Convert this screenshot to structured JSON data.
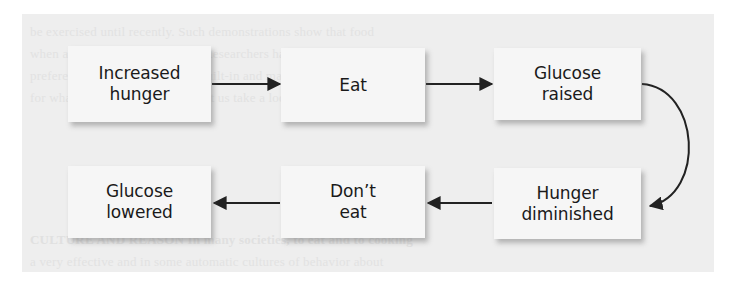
{
  "figure": {
    "type": "flowchart",
    "page_background": "#eeeeee",
    "node_fill": "#f6f6f6",
    "stroke_color": "#222222",
    "nodes": [
      {
        "id": "increased-hunger",
        "label": "Increased\nhunger",
        "line1": "Increased",
        "line2": "hunger",
        "row": 1,
        "col": 1
      },
      {
        "id": "eat",
        "label": "Eat",
        "line1": "Eat",
        "line2": "",
        "row": 1,
        "col": 2
      },
      {
        "id": "glucose-raised",
        "label": "Glucose\nraised",
        "line1": "Glucose",
        "line2": "raised",
        "row": 1,
        "col": 3
      },
      {
        "id": "hunger-diminished",
        "label": "Hunger\ndiminished",
        "line1": "Hunger",
        "line2": "diminished",
        "row": 2,
        "col": 3
      },
      {
        "id": "dont-eat",
        "label": "Don’t\neat",
        "line1": "Don’t",
        "line2": "eat",
        "row": 2,
        "col": 2
      },
      {
        "id": "glucose-lowered",
        "label": "Glucose\nlowered",
        "line1": "Glucose",
        "line2": "lowered",
        "row": 2,
        "col": 1
      }
    ],
    "edges": [
      {
        "id": "e1",
        "from": "increased-hunger",
        "to": "eat",
        "style": "straight",
        "direction": "right"
      },
      {
        "id": "e2",
        "from": "eat",
        "to": "glucose-raised",
        "style": "straight",
        "direction": "right"
      },
      {
        "id": "e3",
        "from": "glucose-raised",
        "to": "hunger-diminished",
        "style": "curved",
        "direction": "down"
      },
      {
        "id": "e4",
        "from": "hunger-diminished",
        "to": "dont-eat",
        "style": "straight",
        "direction": "left"
      },
      {
        "id": "e5",
        "from": "dont-eat",
        "to": "glucose-lowered",
        "style": "straight",
        "direction": "left"
      }
    ],
    "bleed_through": {
      "note": "faint illegible text showing through from reverse of scanned page",
      "lines": [
        "be exercised until recently.  Such demonstrations show that food",
        "when a taste aversion develops. Researchers have reasoned that",
        "preferences for some foods are built-in and may not necessarily",
        "for what have been beneficial. Let us take a look at some of the",
        "CULTURE AND REASON  In many societies, to eat and to cooking",
        "a very effective and in some automatic cultures of behavior about"
      ]
    }
  }
}
